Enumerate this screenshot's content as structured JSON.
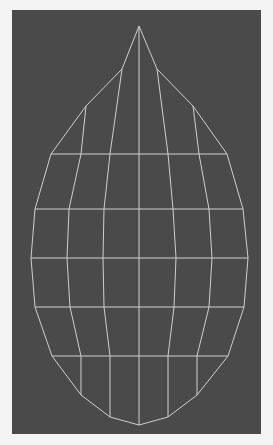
{
  "viewport": {
    "background": "#4a4a4a",
    "frame": "#f4f4f4",
    "line_color": "#cfcfcf",
    "line_width": 1
  },
  "mesh": {
    "shape": "teardrop-wireframe",
    "apex": [
      139,
      26
    ],
    "bottom": [
      139,
      425
    ],
    "outline_left": [
      [
        139,
        26
      ],
      [
        122,
        69
      ],
      [
        86,
        106
      ],
      [
        51,
        154
      ],
      [
        35,
        209
      ],
      [
        31,
        258
      ],
      [
        35,
        307
      ],
      [
        52,
        356
      ],
      [
        81,
        395
      ],
      [
        110,
        417
      ],
      [
        139,
        425
      ]
    ],
    "outline_right": [
      [
        139,
        26
      ],
      [
        157,
        69
      ],
      [
        193,
        106
      ],
      [
        227,
        154
      ],
      [
        243,
        209
      ],
      [
        248,
        258
      ],
      [
        244,
        307
      ],
      [
        228,
        356
      ],
      [
        197,
        395
      ],
      [
        168,
        417
      ],
      [
        139,
        425
      ]
    ],
    "columns": [
      [
        [
          122,
          69
        ],
        [
          110,
          154
        ],
        [
          104,
          209
        ],
        [
          103,
          258
        ],
        [
          104,
          307
        ],
        [
          110,
          356
        ],
        [
          110,
          417
        ]
      ],
      [
        [
          86,
          106
        ],
        [
          81,
          154
        ],
        [
          69,
          209
        ],
        [
          67,
          258
        ],
        [
          70,
          307
        ],
        [
          81,
          356
        ],
        [
          81,
          395
        ]
      ],
      [
        [
          139,
          26
        ],
        [
          139,
          425
        ]
      ],
      [
        [
          157,
          69
        ],
        [
          168,
          154
        ],
        [
          173,
          209
        ],
        [
          176,
          258
        ],
        [
          174,
          307
        ],
        [
          168,
          356
        ],
        [
          168,
          417
        ]
      ],
      [
        [
          193,
          106
        ],
        [
          199,
          154
        ],
        [
          209,
          209
        ],
        [
          212,
          258
        ],
        [
          209,
          307
        ],
        [
          197,
          356
        ],
        [
          197,
          395
        ]
      ]
    ],
    "rows": [
      [
        [
          51,
          154
        ],
        [
          227,
          154
        ]
      ],
      [
        [
          35,
          209
        ],
        [
          243,
          209
        ]
      ],
      [
        [
          31,
          258
        ],
        [
          248,
          258
        ]
      ],
      [
        [
          35,
          307
        ],
        [
          244,
          307
        ]
      ],
      [
        [
          52,
          356
        ],
        [
          228,
          356
        ]
      ]
    ]
  }
}
